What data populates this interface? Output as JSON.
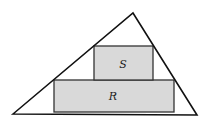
{
  "diagram": {
    "triangle": {
      "points": [
        [
          13,
          114
        ],
        [
          133,
          13
        ],
        [
          197,
          115
        ]
      ],
      "stroke": "#111111"
    },
    "rectangles": [
      {
        "id": "R",
        "label": "R",
        "x": 54,
        "y": 80,
        "width": 120,
        "height": 32,
        "fill": "#d9d9d9",
        "stroke": "#333333",
        "label_x": 113,
        "label_y": 100
      },
      {
        "id": "S",
        "label": "S",
        "x": 94,
        "y": 46,
        "width": 59,
        "height": 34,
        "fill": "#d9d9d9",
        "stroke": "#333333",
        "label_x": 123,
        "label_y": 68
      }
    ]
  }
}
